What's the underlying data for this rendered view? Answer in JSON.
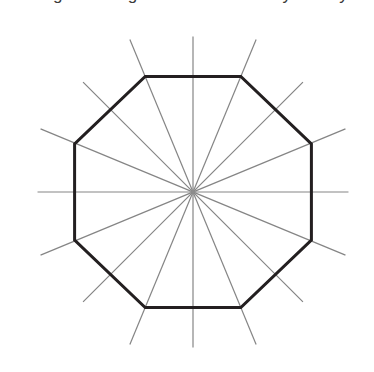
{
  "page": {
    "background_color": "#ffffff",
    "width": 374,
    "height": 372
  },
  "title": {
    "text": "A regular octagon and its lines of symmetry.",
    "color": "#3a3a3a",
    "clipped": "true"
  },
  "figure": {
    "caption_alt": "Regular octagon with 8 lines of symmetry drawn through its center",
    "shape_name": "regular octagon",
    "sides": 8,
    "lines_of_symmetry": 8
  },
  "chart_data": {
    "type": "diagram",
    "title": "A regular octagon and its lines of symmetry.",
    "shape": "regular octagon",
    "n_sides": 8,
    "n_lines_of_symmetry": 8,
    "center": {
      "x": 193,
      "y": 192
    },
    "circumradius": 125,
    "vertex_start_angle_deg": 67.5,
    "polygon_stroke": "#231f20",
    "polygon_stroke_width": 3,
    "polygon_fill": "none",
    "symmetry_line_stroke": "#858585",
    "symmetry_line_width": 1.2,
    "symmetry_line_extension": 40,
    "symmetry_line_angles_deg": [
      0,
      22.5,
      45,
      67.5,
      90,
      112.5,
      135,
      157.5
    ],
    "polygon_vertices": [
      {
        "x": 145.2,
        "y": 76.5
      },
      {
        "x": 240.8,
        "y": 76.5
      },
      {
        "x": 311.4,
        "y": 144.0
      },
      {
        "x": 311.4,
        "y": 240.0
      },
      {
        "x": 240.8,
        "y": 307.5
      },
      {
        "x": 145.2,
        "y": 307.5
      },
      {
        "x": 74.6,
        "y": 240.0
      },
      {
        "x": 74.6,
        "y": 144.0
      }
    ],
    "bounds": {
      "left": 72,
      "top": 71,
      "right": 313,
      "bottom": 312
    },
    "grid": "off",
    "legend": "none",
    "xlabel": "",
    "ylabel": ""
  }
}
